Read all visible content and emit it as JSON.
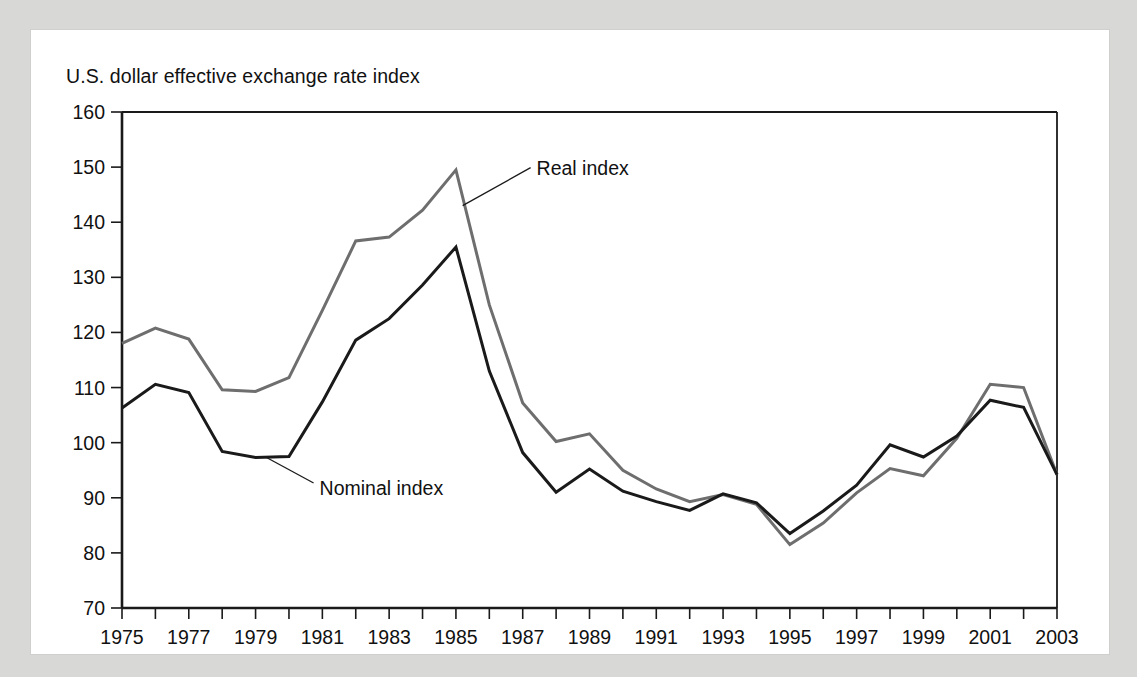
{
  "figure": {
    "title": "U.S. dollar effective exchange rate index",
    "background_color": "#d8d8d6",
    "panel_color": "#ffffff"
  },
  "chart_data": {
    "type": "line",
    "title": "U.S. dollar effective exchange rate index",
    "xlabel": "",
    "ylabel": "",
    "xlim": [
      1975,
      2003
    ],
    "ylim": [
      70,
      160
    ],
    "yticks": [
      70,
      80,
      90,
      100,
      110,
      120,
      130,
      140,
      150,
      160
    ],
    "ytick_labels": [
      "70",
      "80",
      "90",
      "100",
      "110",
      "120",
      "130",
      "140",
      "150",
      "160"
    ],
    "xticks": [
      1975,
      1976,
      1977,
      1978,
      1979,
      1980,
      1981,
      1982,
      1983,
      1984,
      1985,
      1986,
      1987,
      1988,
      1989,
      1990,
      1991,
      1992,
      1993,
      1994,
      1995,
      1996,
      1997,
      1998,
      1999,
      2000,
      2001,
      2002,
      2003
    ],
    "xtick_labels_shown": [
      "1975",
      "1977",
      "1979",
      "1981",
      "1983",
      "1985",
      "1987",
      "1989",
      "1991",
      "1993",
      "1995",
      "1997",
      "1999",
      "2001",
      "2003"
    ],
    "grid": false,
    "legend_position": "inline-annotations",
    "x": [
      1975,
      1976,
      1977,
      1978,
      1979,
      1980,
      1981,
      1982,
      1983,
      1984,
      1985,
      1986,
      1987,
      1988,
      1989,
      1990,
      1991,
      1992,
      1993,
      1994,
      1995,
      1996,
      1997,
      1998,
      1999,
      2000,
      2001,
      2002,
      2003
    ],
    "series": [
      {
        "name": "Real index",
        "color": "#6e6e6e",
        "stroke_width": 3.0,
        "values": [
          118.0,
          120.8,
          118.8,
          109.6,
          109.3,
          111.8,
          124.0,
          136.6,
          137.3,
          142.2,
          149.5,
          125.0,
          107.2,
          100.2,
          101.6,
          95.0,
          91.6,
          89.3,
          90.6,
          88.8,
          81.5,
          85.4,
          90.9,
          95.3,
          94.0,
          100.8,
          110.6,
          110.0,
          94.2
        ]
      },
      {
        "name": "Nominal index",
        "color": "#1a1a1a",
        "stroke_width": 3.0,
        "values": [
          106.3,
          110.6,
          109.1,
          98.4,
          97.3,
          97.5,
          107.4,
          118.6,
          122.5,
          128.6,
          135.5,
          113.0,
          98.2,
          91.0,
          95.2,
          91.2,
          89.3,
          87.7,
          90.7,
          89.1,
          83.5,
          87.6,
          92.3,
          99.6,
          97.4,
          101.2,
          107.7,
          106.4,
          94.2
        ]
      }
    ],
    "annotations": [
      {
        "text": "Real index",
        "target_series": "Real index",
        "target_x": 1985.2,
        "target_y": 143.0
      },
      {
        "text": "Nominal index",
        "target_series": "Nominal index",
        "target_x": 1979.3,
        "target_y": 97.4
      }
    ]
  }
}
